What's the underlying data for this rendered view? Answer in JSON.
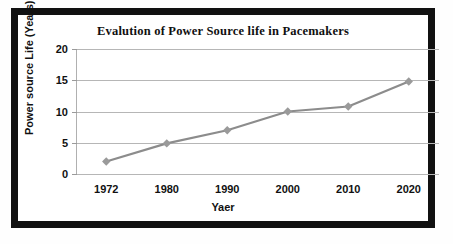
{
  "chart_data": {
    "type": "line",
    "title": "Evalution of Power  Source life in Pacemakers",
    "xlabel": "Yaer",
    "ylabel": "Power source Life (Years)",
    "categories": [
      "1972",
      "1980",
      "1990",
      "2000",
      "2010",
      "2020"
    ],
    "x": [
      1972,
      1980,
      1990,
      2000,
      2010,
      2020
    ],
    "values": [
      2,
      4.9,
      7,
      10,
      10.8,
      14.8
    ],
    "series": [
      {
        "name": "Power source Life (Years)",
        "values": [
          2,
          4.9,
          7,
          10,
          10.8,
          14.8
        ]
      }
    ],
    "ylim": [
      0,
      20
    ],
    "yticks": [
      0,
      5,
      10,
      15,
      20
    ],
    "ytick_labels": [
      "0",
      "5",
      "10",
      "15",
      "20"
    ],
    "grid": true,
    "grid_axis": "y",
    "legend": false,
    "legend_position": "none",
    "marker": "diamond",
    "line_color": "#8c8c8c",
    "marker_color": "#9a9a9a",
    "grid_color": "#b6b6b6",
    "text_color": "#111111",
    "frame_color": "#111111",
    "background": "#ffffff"
  }
}
